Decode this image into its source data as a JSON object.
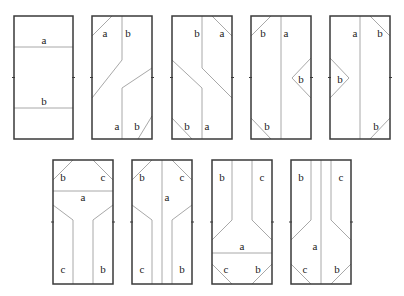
{
  "diagram": {
    "panels": [
      {
        "id": 1,
        "x": 14,
        "y": 16,
        "w": 59,
        "h": 123,
        "lines": [
          [
            14,
            47,
            73,
            47
          ],
          [
            14,
            108,
            73,
            108
          ]
        ],
        "labels": [
          {
            "t": "a",
            "x": 44,
            "y": 41
          },
          {
            "t": "b",
            "x": 44,
            "y": 102
          }
        ]
      },
      {
        "id": 2,
        "x": 92,
        "y": 16,
        "w": 60,
        "h": 123,
        "lines": [
          [
            112,
            16,
            92,
            36
          ],
          [
            122,
            16,
            122,
            60
          ],
          [
            122,
            60,
            92,
            98
          ],
          [
            152,
            68,
            122,
            88
          ],
          [
            122,
            88,
            122,
            139
          ],
          [
            152,
            116,
            138,
            139
          ]
        ],
        "labels": [
          {
            "t": "a",
            "x": 105,
            "y": 34
          },
          {
            "t": "b",
            "x": 128,
            "y": 34
          },
          {
            "t": "a",
            "x": 117,
            "y": 127
          },
          {
            "t": "b",
            "x": 137,
            "y": 127
          }
        ]
      },
      {
        "id": 3,
        "x": 172,
        "y": 16,
        "w": 60,
        "h": 123,
        "lines": [
          [
            212,
            16,
            232,
            36
          ],
          [
            202,
            16,
            202,
            68
          ],
          [
            202,
            68,
            232,
            98
          ],
          [
            172,
            60,
            202,
            88
          ],
          [
            202,
            88,
            202,
            139
          ],
          [
            172,
            118,
            192,
            139
          ]
        ],
        "labels": [
          {
            "t": "b",
            "x": 197,
            "y": 34
          },
          {
            "t": "a",
            "x": 222,
            "y": 34
          },
          {
            "t": "b",
            "x": 187,
            "y": 127
          },
          {
            "t": "a",
            "x": 207,
            "y": 127
          }
        ]
      },
      {
        "id": 4,
        "x": 251,
        "y": 16,
        "w": 60,
        "h": 123,
        "lines": [
          [
            271,
            16,
            251,
            36
          ],
          [
            281,
            16,
            281,
            139
          ],
          [
            311,
            58,
            292,
            78
          ],
          [
            292,
            78,
            311,
            98
          ],
          [
            251,
            118,
            271,
            139
          ]
        ],
        "labels": [
          {
            "t": "b",
            "x": 263,
            "y": 34
          },
          {
            "t": "a",
            "x": 286,
            "y": 34
          },
          {
            "t": "b",
            "x": 301,
            "y": 80
          },
          {
            "t": "b",
            "x": 267,
            "y": 127
          }
        ]
      },
      {
        "id": 5,
        "x": 330,
        "y": 16,
        "w": 60,
        "h": 123,
        "lines": [
          [
            370,
            16,
            390,
            36
          ],
          [
            360,
            16,
            360,
            139
          ],
          [
            330,
            58,
            349,
            78
          ],
          [
            349,
            78,
            330,
            98
          ],
          [
            390,
            118,
            370,
            139
          ]
        ],
        "labels": [
          {
            "t": "a",
            "x": 355,
            "y": 34
          },
          {
            "t": "b",
            "x": 380,
            "y": 34
          },
          {
            "t": "b",
            "x": 340,
            "y": 80
          },
          {
            "t": "b",
            "x": 376,
            "y": 127
          }
        ]
      },
      {
        "id": 6,
        "x": 53,
        "y": 160,
        "w": 60,
        "h": 124,
        "lines": [
          [
            73,
            160,
            53,
            180
          ],
          [
            93,
            160,
            113,
            180
          ],
          [
            53,
            191,
            113,
            191
          ],
          [
            53,
            205,
            73,
            220
          ],
          [
            73,
            220,
            73,
            284
          ],
          [
            113,
            205,
            93,
            220
          ],
          [
            93,
            220,
            93,
            284
          ]
        ],
        "labels": [
          {
            "t": "b",
            "x": 63,
            "y": 178
          },
          {
            "t": "c",
            "x": 103,
            "y": 178
          },
          {
            "t": "a",
            "x": 83,
            "y": 198
          },
          {
            "t": "c",
            "x": 63,
            "y": 270
          },
          {
            "t": "b",
            "x": 103,
            "y": 270
          }
        ]
      },
      {
        "id": 7,
        "x": 132,
        "y": 160,
        "w": 60,
        "h": 124,
        "lines": [
          [
            152,
            160,
            132,
            180
          ],
          [
            172,
            160,
            192,
            180
          ],
          [
            132,
            205,
            152,
            220
          ],
          [
            152,
            220,
            152,
            284
          ],
          [
            192,
            205,
            172,
            220
          ],
          [
            172,
            220,
            172,
            284
          ],
          [
            162,
            160,
            162,
            284
          ]
        ],
        "labels": [
          {
            "t": "b",
            "x": 142,
            "y": 178
          },
          {
            "t": "c",
            "x": 182,
            "y": 178
          },
          {
            "t": "a",
            "x": 167,
            "y": 198
          },
          {
            "t": "c",
            "x": 142,
            "y": 270
          },
          {
            "t": "b",
            "x": 182,
            "y": 270
          }
        ]
      },
      {
        "id": 8,
        "x": 212,
        "y": 160,
        "w": 60,
        "h": 124,
        "lines": [
          [
            232,
            160,
            232,
            220
          ],
          [
            232,
            220,
            212,
            240
          ],
          [
            252,
            160,
            252,
            220
          ],
          [
            252,
            220,
            272,
            240
          ],
          [
            212,
            253,
            272,
            253
          ],
          [
            212,
            264,
            232,
            284
          ],
          [
            272,
            264,
            252,
            284
          ]
        ],
        "labels": [
          {
            "t": "b",
            "x": 222,
            "y": 178
          },
          {
            "t": "c",
            "x": 262,
            "y": 178
          },
          {
            "t": "a",
            "x": 242,
            "y": 247
          },
          {
            "t": "c",
            "x": 226,
            "y": 270
          },
          {
            "t": "b",
            "x": 258,
            "y": 270
          }
        ]
      },
      {
        "id": 9,
        "x": 291,
        "y": 160,
        "w": 60,
        "h": 124,
        "lines": [
          [
            311,
            160,
            311,
            220
          ],
          [
            311,
            220,
            291,
            240
          ],
          [
            331,
            160,
            331,
            220
          ],
          [
            331,
            220,
            351,
            240
          ],
          [
            321,
            160,
            321,
            284
          ],
          [
            291,
            264,
            311,
            284
          ],
          [
            351,
            264,
            331,
            284
          ]
        ],
        "labels": [
          {
            "t": "b",
            "x": 301,
            "y": 178
          },
          {
            "t": "c",
            "x": 341,
            "y": 178
          },
          {
            "t": "a",
            "x": 315,
            "y": 247
          },
          {
            "t": "c",
            "x": 305,
            "y": 270
          },
          {
            "t": "b",
            "x": 337,
            "y": 270
          }
        ]
      }
    ]
  }
}
